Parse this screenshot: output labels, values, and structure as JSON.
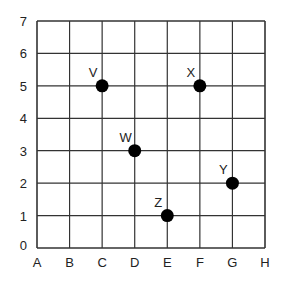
{
  "chart_data": {
    "type": "scatter",
    "title": "",
    "xlabel": "",
    "ylabel": "",
    "x_categories": [
      "A",
      "B",
      "C",
      "D",
      "E",
      "F",
      "G",
      "H"
    ],
    "y_ticks": [
      0,
      1,
      2,
      3,
      4,
      5,
      6,
      7
    ],
    "ylim": [
      0,
      7
    ],
    "grid": true,
    "legend": null,
    "points": [
      {
        "label": "V",
        "x": "C",
        "y": 5
      },
      {
        "label": "X",
        "x": "F",
        "y": 5
      },
      {
        "label": "W",
        "x": "D",
        "y": 3
      },
      {
        "label": "Y",
        "x": "G",
        "y": 2
      },
      {
        "label": "Z",
        "x": "E",
        "y": 1
      }
    ]
  },
  "colors": {
    "grid": "#333333",
    "point": "#000000",
    "text": "#222222"
  }
}
